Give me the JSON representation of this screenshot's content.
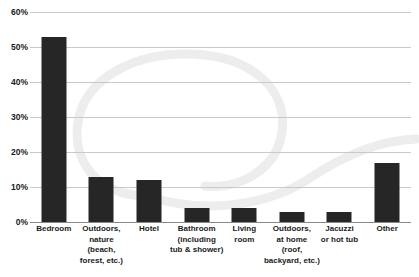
{
  "chart_data": {
    "type": "bar",
    "title": "",
    "subtitle": "",
    "xlabel": "",
    "ylabel": "",
    "ylim": [
      0,
      60
    ],
    "ytick_labels": [
      "0%",
      "10%",
      "20%",
      "30%",
      "40%",
      "50%",
      "60%"
    ],
    "ytick_values": [
      0,
      10,
      20,
      30,
      40,
      50,
      60
    ],
    "grid": true,
    "legend": "none",
    "value_suffix": "%",
    "bar_color": "#262626",
    "grid_color": "#c9c9c9",
    "axis_color": "#8a8a8a",
    "background_color": "#ffffff",
    "watermark_color": "#ededed",
    "categories": [
      "Bedroom",
      "Outdoors, nature (beach, forest, etc.)",
      "Hotel",
      "Bathroom (including tub & shower)",
      "Living room",
      "Outdoors, at home (roof, backyard, etc.)",
      "Jacuzzi or hot tub",
      "Other"
    ],
    "category_label_lines": [
      [
        "Bedroom"
      ],
      [
        "Outdoors,",
        "nature",
        "(beach,",
        "forest, etc.)"
      ],
      [
        "Hotel"
      ],
      [
        "Bathroom",
        "(including",
        "tub & shower)"
      ],
      [
        "Living",
        "room"
      ],
      [
        "Outdoors,",
        "at home",
        "(roof,",
        "backyard, etc.)"
      ],
      [
        "Jacuzzi",
        "or hot tub"
      ],
      [
        "Other"
      ]
    ],
    "values": [
      53,
      13,
      12,
      4,
      4,
      3,
      3,
      17
    ]
  }
}
